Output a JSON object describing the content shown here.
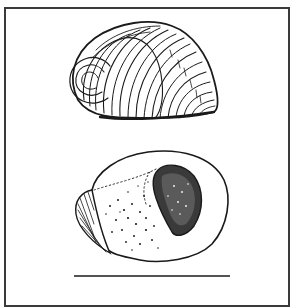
{
  "figure": {
    "type": "scientific-illustration",
    "views": [
      {
        "name": "dorsal-view",
        "description": "shell with concentric growth ridges, spiral apex at left"
      },
      {
        "name": "ventral-view",
        "description": "shell underside with stippled surface and dark stippled aperture"
      }
    ],
    "scale_bar": {
      "present": true,
      "label": ""
    },
    "colors": {
      "ink": "#1a1a1a",
      "border": "#3a3a3a",
      "background": "#ffffff"
    }
  }
}
